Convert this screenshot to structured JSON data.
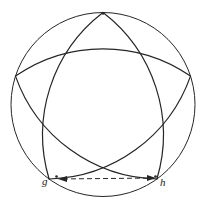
{
  "figure": {
    "type": "geometric-diagram",
    "background_color": "#ffffff",
    "stroke_color": "#262626",
    "canvas": {
      "width": 202,
      "height": 201
    },
    "circle": {
      "name": "outer-circle",
      "cx": 103,
      "cy": 104.5,
      "r": 92,
      "stroke_width": 1.0
    },
    "star": {
      "name": "curved-five-pointed-star",
      "stroke_width": 1.2,
      "arc_bulge": 62,
      "vertices": [
        {
          "id": "top",
          "label": "",
          "x": 103.0,
          "y": 12.5
        },
        {
          "id": "right",
          "label": "",
          "x": 190.5,
          "y": 76.1
        },
        {
          "id": "bottom-right",
          "label": "h",
          "x": 156.9,
          "y": 179.0
        },
        {
          "id": "bottom-left",
          "label": "g",
          "x": 49.1,
          "y": 179.0
        },
        {
          "id": "left",
          "label": "",
          "x": 15.5,
          "y": 76.1
        }
      ],
      "arcs": [
        {
          "from": "top",
          "to": "bottom-right"
        },
        {
          "from": "bottom-right",
          "to": "left"
        },
        {
          "from": "left",
          "to": "right"
        },
        {
          "from": "right",
          "to": "bottom-left"
        },
        {
          "from": "bottom-left",
          "to": "top"
        }
      ]
    },
    "chord": {
      "name": "dashed-chord-gh",
      "from": "g",
      "to": "h",
      "x1": 58,
      "y1": 179,
      "x2": 156,
      "y2": 178,
      "style": "dashed",
      "dash_pattern": "5 3",
      "stroke_width": 1.0,
      "arrowheads": "both"
    },
    "labels": {
      "g": "g",
      "h": "h"
    }
  }
}
